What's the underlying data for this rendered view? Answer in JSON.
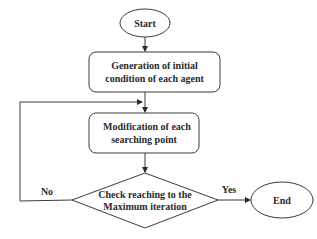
{
  "diagram": {
    "type": "flowchart",
    "nodes": {
      "start": {
        "label": "Start",
        "shape": "ellipse"
      },
      "init": {
        "line1": "Generation of initial",
        "line2": "condition of each agent",
        "shape": "rounded-rect"
      },
      "modify": {
        "line1": "Modification of each",
        "line2": "searching point",
        "shape": "rounded-rect"
      },
      "check": {
        "line1": "Check reaching to the",
        "line2": "Maximum iteration",
        "shape": "diamond"
      },
      "end": {
        "label": "End",
        "shape": "ellipse"
      }
    },
    "edges": {
      "no_label": "No",
      "yes_label": "Yes"
    },
    "colors": {
      "stroke": "#3a3a3a",
      "text": "#2a2a2a",
      "background": "#ffffff"
    }
  }
}
